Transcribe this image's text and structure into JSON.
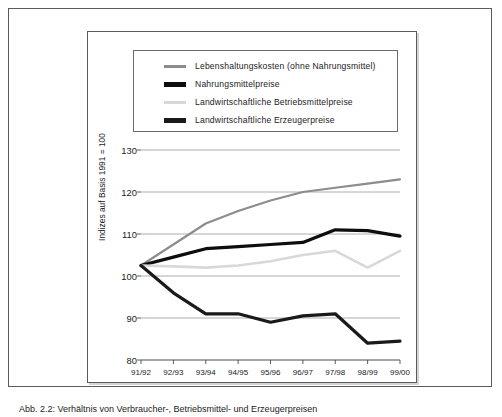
{
  "caption": "Abb. 2.2: Verhältnis von Verbraucher-, Betriebsmittel- und Erzeugerpreisen",
  "legend": {
    "items": [
      {
        "label": "Lebenshaltungskosten (ohne Nahrungsmittel)",
        "color": "#8c8c8c",
        "weight": 3
      },
      {
        "label": "Nahrungsmittelpreise",
        "color": "#0d0d0d",
        "weight": 5
      },
      {
        "label": "Landwirtschaftliche Betriebsmittelpreise",
        "color": "#d8d8d8",
        "weight": 3
      },
      {
        "label": "Landwirtschaftliche Erzeugerpreise",
        "color": "#1a1a1a",
        "weight": 5
      }
    ]
  },
  "chart_data": {
    "type": "line",
    "title": "",
    "xlabel": "",
    "ylabel": "Indizes auf Basis 1991 = 100",
    "categories": [
      "91/92",
      "92/93",
      "93/94",
      "94/95",
      "95/96",
      "96/97",
      "97/98",
      "98/99",
      "99/00"
    ],
    "ylim": [
      80,
      130
    ],
    "yticks": [
      80,
      90,
      100,
      110,
      120,
      130
    ],
    "grid": true,
    "legend_position": "top",
    "series": [
      {
        "name": "Lebenshaltungskosten (ohne Nahrungsmittel)",
        "color": "#8c8c8c",
        "width": 2.1,
        "values": [
          102.5,
          107.5,
          112.5,
          115.5,
          118.0,
          120.0,
          121.0,
          122.0,
          123.0
        ]
      },
      {
        "name": "Nahrungsmittelpreise",
        "color": "#0d0d0d",
        "width": 3.2,
        "values": [
          102.5,
          104.5,
          106.5,
          107.0,
          107.5,
          108.0,
          111.0,
          110.8,
          109.5
        ]
      },
      {
        "name": "Landwirtschaftliche Betriebsmittelpreise",
        "color": "#d8d8d8",
        "width": 2.6,
        "values": [
          102.5,
          102.3,
          102.0,
          102.5,
          103.5,
          105.0,
          106.0,
          102.0,
          106.0
        ]
      },
      {
        "name": "Landwirtschaftliche Erzeugerpreise",
        "color": "#1a1a1a",
        "width": 3.2,
        "values": [
          102.5,
          96.0,
          91.0,
          91.0,
          89.0,
          90.5,
          91.0,
          84.0,
          84.5
        ]
      }
    ]
  }
}
